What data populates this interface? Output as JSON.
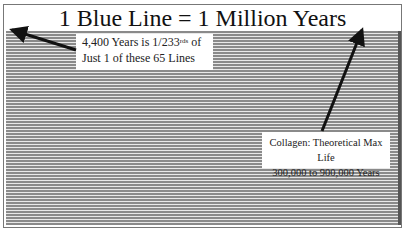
{
  "title": "1 Blue Line = 1 Million Years",
  "callout_left": {
    "line1_pre": "4,400 Years is 1/233",
    "line1_sup": "rds",
    "line1_post": " of",
    "line2": "Just 1 of these 65 Lines"
  },
  "callout_right": {
    "line1": "Collagen: Theoretical Max Life",
    "line2": "300,000 to 900,000 Years"
  },
  "line_count": 65,
  "colors": {
    "line": "#8a8a8a",
    "gap": "#e8e8e8",
    "arrow": "#111111"
  }
}
